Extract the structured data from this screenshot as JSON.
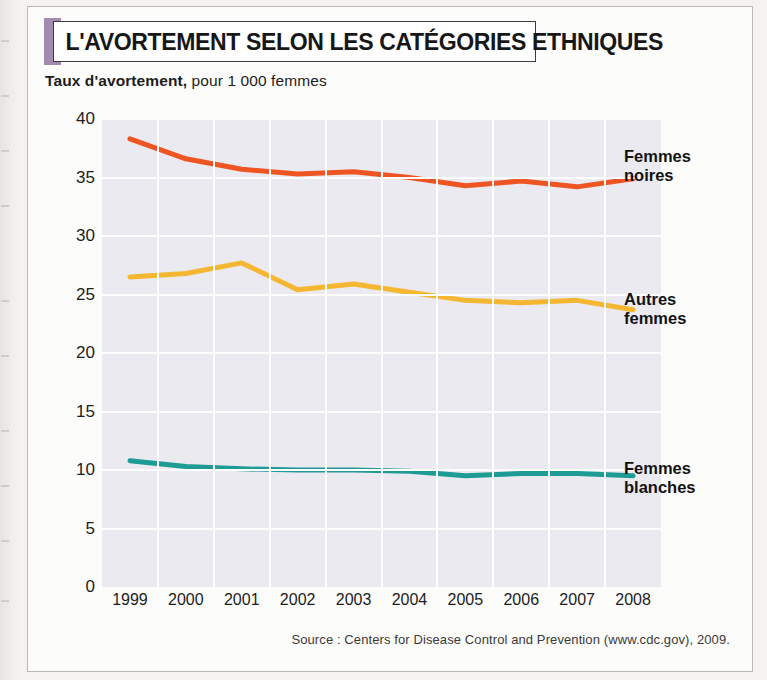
{
  "header": {
    "title": "L'AVORTEMENT SELON LES CATÉGORIES ETHNIQUES",
    "subtitle_bold": "Taux d'avortement,",
    "subtitle_light": " pour 1 000 femmes",
    "subtitle_full": "Taux d'avortement, pour 1 000 femmes",
    "accent_color": "#a18bb0"
  },
  "source": {
    "text": "Source : Centers for Disease Control and Prevention (www.cdc.gov), 2009."
  },
  "legend": [
    {
      "line1": "Femmes",
      "line2": "noires",
      "color": "#ee5522"
    },
    {
      "line1": "Autres",
      "line2": "femmes",
      "color": "#f5b731"
    },
    {
      "line1": "Femmes",
      "line2": "blanches",
      "color": "#1e9b94"
    }
  ],
  "chart_data": {
    "type": "line",
    "title": "L'AVORTEMENT SELON LES CATÉGORIES ETHNIQUES",
    "subtitle": "Taux d'avortement, pour 1 000 femmes",
    "xlabel": "",
    "ylabel": "Taux d'avortement, pour 1 000 femmes",
    "x": [
      "1999",
      "2000",
      "2001",
      "2002",
      "2003",
      "2004",
      "2005",
      "2006",
      "2007",
      "2008"
    ],
    "categories": [
      "1999",
      "2000",
      "2001",
      "2002",
      "2003",
      "2004",
      "2005",
      "2006",
      "2007",
      "2008"
    ],
    "ylim": [
      0,
      40
    ],
    "yticks": [
      0,
      5,
      10,
      15,
      20,
      25,
      30,
      35,
      40
    ],
    "ytick_labels": [
      "0",
      "5",
      "10",
      "15",
      "20",
      "25",
      "30",
      "35",
      "40"
    ],
    "grid": true,
    "legend_position": "right",
    "plot_background": "#ebeaf0",
    "gridline_color": "#fdfdfd",
    "series": [
      {
        "name": "Femmes noires",
        "color": "#ee5522",
        "values": [
          38.3,
          36.6,
          35.7,
          35.3,
          35.5,
          35.0,
          34.3,
          34.7,
          34.2,
          34.9
        ]
      },
      {
        "name": "Autres femmes",
        "color": "#f5b731",
        "values": [
          26.5,
          26.8,
          27.7,
          25.4,
          25.9,
          25.2,
          24.5,
          24.3,
          24.5,
          23.7
        ]
      },
      {
        "name": "Femmes blanches",
        "color": "#1e9b94",
        "values": [
          10.8,
          10.3,
          10.1,
          10.0,
          10.0,
          9.9,
          9.5,
          9.7,
          9.7,
          9.5
        ]
      }
    ]
  }
}
